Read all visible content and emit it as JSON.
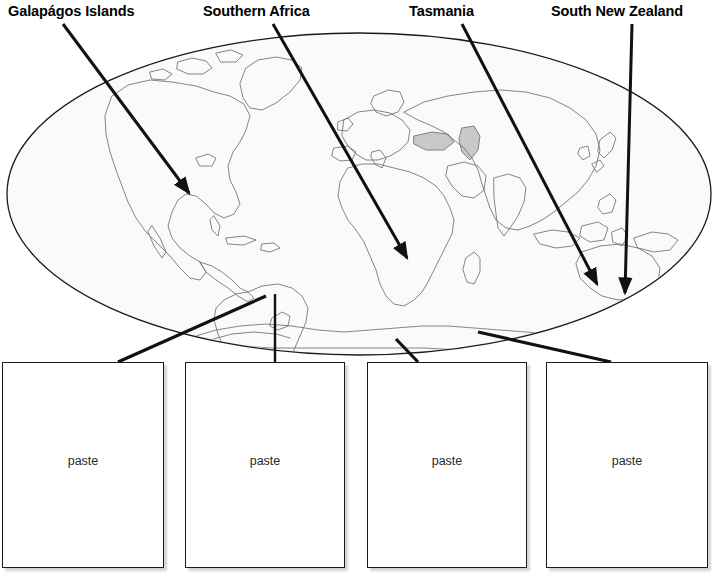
{
  "worksheet": {
    "title": "World Map Labelling Worksheet",
    "background_color": "#ffffff"
  },
  "callouts": [
    {
      "id": "galapagos",
      "label": "Galapágos Islands",
      "icon": "pointer-line-icon",
      "line": {
        "x1": 63,
        "y1": 24,
        "x2": 189,
        "y2": 193
      },
      "arrow": true
    },
    {
      "id": "southern-africa",
      "label": "Southern Africa",
      "icon": "pointer-line-icon",
      "line": {
        "x1": 273,
        "y1": 24,
        "x2": 407,
        "y2": 258
      },
      "arrow": true
    },
    {
      "id": "tasmania",
      "label": "Tasmania",
      "icon": "pointer-line-icon",
      "line": {
        "x1": 462,
        "y1": 24,
        "x2": 597,
        "y2": 284
      },
      "arrow": true
    },
    {
      "id": "south-new-zealand",
      "label": "South New Zealand",
      "icon": "pointer-line-icon",
      "line": {
        "x1": 632,
        "y1": 24,
        "x2": 625,
        "y2": 293
      },
      "arrow": true
    }
  ],
  "globe": {
    "name": "world-map-ellipse",
    "center_x": 359,
    "center_y": 194,
    "radius_x": 352,
    "radius_y": 161,
    "fill_color": "#fafafa",
    "stroke_color": "#1a1a1a",
    "coastline_color": "#6b6b6b"
  },
  "connectors": [
    {
      "id": "connector-1",
      "x1": 266,
      "y1": 296,
      "x2": 118,
      "y2": 362
    },
    {
      "id": "connector-2",
      "x1": 275,
      "y1": 294,
      "x2": 275,
      "y2": 362
    },
    {
      "id": "connector-3",
      "x1": 396,
      "y1": 339,
      "x2": 418,
      "y2": 362
    },
    {
      "id": "connector-4",
      "x1": 478,
      "y1": 332,
      "x2": 611,
      "y2": 362
    }
  ],
  "paste_boxes": [
    {
      "id": "paste-box-1",
      "label": "paste"
    },
    {
      "id": "paste-box-2",
      "label": "paste"
    },
    {
      "id": "paste-box-3",
      "label": "paste"
    },
    {
      "id": "paste-box-4",
      "label": "paste"
    }
  ]
}
